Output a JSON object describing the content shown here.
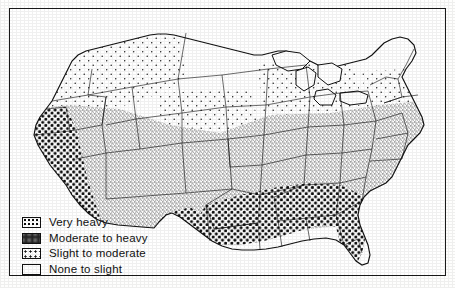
{
  "map": {
    "title": "United States map of infestation severity",
    "frame_border_color": "#1a1a1a",
    "background_color": "#ffffff",
    "ink_color": "#111111"
  },
  "legend": {
    "items": [
      {
        "label": "Very heavy",
        "pattern": "coarse-dense-dots",
        "swatch_name": "legend-swatch-very-heavy"
      },
      {
        "label": "Moderate to heavy",
        "pattern": "fine-dense-stipple",
        "swatch_name": "legend-swatch-moderate-to-heavy"
      },
      {
        "label": "Slight to moderate",
        "pattern": "sparse-dots",
        "swatch_name": "legend-swatch-slight-to-moderate"
      },
      {
        "label": "None to slight",
        "pattern": "blank",
        "swatch_name": "legend-swatch-none-to-slight"
      }
    ]
  },
  "regions": [
    {
      "name": "Washington",
      "class": "slight-to-moderate"
    },
    {
      "name": "Oregon",
      "class": "slight-to-moderate"
    },
    {
      "name": "Idaho",
      "class": "slight-to-moderate"
    },
    {
      "name": "Montana",
      "class": "none-to-slight"
    },
    {
      "name": "North Dakota",
      "class": "none-to-slight"
    },
    {
      "name": "South Dakota",
      "class": "none-to-slight"
    },
    {
      "name": "Minnesota",
      "class": "none-to-slight"
    },
    {
      "name": "Wisconsin",
      "class": "slight-to-moderate"
    },
    {
      "name": "Michigan",
      "class": "slight-to-moderate"
    },
    {
      "name": "Maine",
      "class": "none-to-slight"
    },
    {
      "name": "New Hampshire",
      "class": "none-to-slight"
    },
    {
      "name": "Vermont",
      "class": "none-to-slight"
    },
    {
      "name": "New York",
      "class": "slight-to-moderate"
    },
    {
      "name": "Wyoming",
      "class": "slight-to-moderate"
    },
    {
      "name": "Nevada",
      "class": "moderate-to-heavy"
    },
    {
      "name": "Utah",
      "class": "moderate-to-heavy"
    },
    {
      "name": "Colorado",
      "class": "moderate-to-heavy"
    },
    {
      "name": "Nebraska",
      "class": "slight-to-moderate"
    },
    {
      "name": "Iowa",
      "class": "moderate-to-heavy"
    },
    {
      "name": "Illinois",
      "class": "moderate-to-heavy"
    },
    {
      "name": "Indiana",
      "class": "moderate-to-heavy"
    },
    {
      "name": "Ohio",
      "class": "moderate-to-heavy"
    },
    {
      "name": "Pennsylvania",
      "class": "moderate-to-heavy"
    },
    {
      "name": "California",
      "class": "very-heavy"
    },
    {
      "name": "Arizona",
      "class": "moderate-to-heavy"
    },
    {
      "name": "New Mexico",
      "class": "moderate-to-heavy"
    },
    {
      "name": "Kansas",
      "class": "moderate-to-heavy"
    },
    {
      "name": "Missouri",
      "class": "moderate-to-heavy"
    },
    {
      "name": "Kentucky",
      "class": "moderate-to-heavy"
    },
    {
      "name": "Virginia",
      "class": "moderate-to-heavy"
    },
    {
      "name": "Tennessee",
      "class": "moderate-to-heavy"
    },
    {
      "name": "Oklahoma",
      "class": "moderate-to-heavy"
    },
    {
      "name": "Texas",
      "class": "moderate-to-heavy"
    },
    {
      "name": "Arkansas",
      "class": "very-heavy"
    },
    {
      "name": "Louisiana",
      "class": "very-heavy"
    },
    {
      "name": "Mississippi",
      "class": "very-heavy"
    },
    {
      "name": "Alabama",
      "class": "very-heavy"
    },
    {
      "name": "Georgia",
      "class": "very-heavy"
    },
    {
      "name": "Florida",
      "class": "very-heavy"
    },
    {
      "name": "South Carolina",
      "class": "very-heavy"
    },
    {
      "name": "North Carolina",
      "class": "moderate-to-heavy"
    }
  ]
}
